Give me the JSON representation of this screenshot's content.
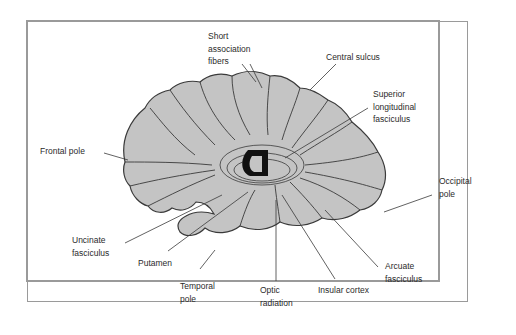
{
  "figure": {
    "colors": {
      "brain_fill": "#c4c4c4",
      "outline": "#3a3a3a",
      "border": "#9a9a9a",
      "label_text": "#2b2b2b",
      "background": "#ffffff"
    },
    "labels": {
      "short_association_fibers": "Short\nassociation\nfibers",
      "central_sulcus": "Central sulcus",
      "superior_longitudinal_fasciculus": "Superior\nlongitudinal\nfasciculus",
      "frontal_pole": "Frontal pole",
      "occipital_pole": "Occipital\npole",
      "uncinate_fasciculus": "Uncinate\nfasciculus",
      "putamen": "Putamen",
      "temporal_pole": "Temporal\npole",
      "optic_radiation": "Optic\nradiation",
      "insular_cortex": "Insular cortex",
      "arcuate_fasciculus": "Arcuate\nfasciculus"
    }
  }
}
